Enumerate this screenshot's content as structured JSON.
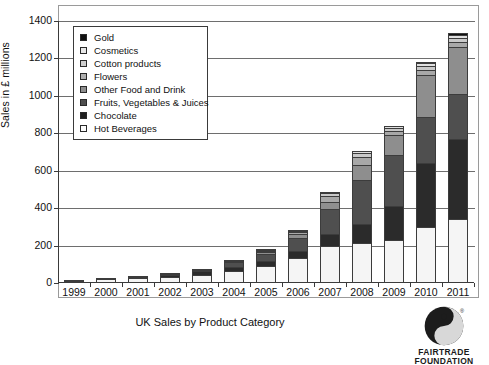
{
  "chart_data": {
    "type": "bar",
    "stacked": true,
    "title": "UK Sales by Product Category",
    "xlabel": "",
    "ylabel": "Sales in £ millions",
    "ylim": [
      0,
      1400
    ],
    "ytick_step": 200,
    "yticks": [
      "0",
      "200",
      "400",
      "600",
      "800",
      "1000",
      "1200",
      "1400"
    ],
    "grid": true,
    "legend_position": "top-left-inside",
    "categories": [
      "1999",
      "2000",
      "2001",
      "2002",
      "2003",
      "2004",
      "2005",
      "2006",
      "2007",
      "2008",
      "2009",
      "2010",
      "2011"
    ],
    "series": [
      {
        "name": "Hot Beverages",
        "color": "#f5f5f5",
        "values": [
          15,
          21,
          27,
          34,
          46,
          66,
          94,
          136,
          200,
          216,
          232,
          300,
          340
        ]
      },
      {
        "name": "Chocolate",
        "color": "#2b2b2b",
        "values": [
          1,
          5,
          10,
          14,
          19,
          25,
          30,
          36,
          60,
          100,
          180,
          340,
          430
        ]
      },
      {
        "name": "Fruits, Vegetables & Juices",
        "color": "#4f4f4f",
        "values": [
          0,
          0,
          2,
          4,
          8,
          25,
          40,
          70,
          135,
          235,
          270,
          250,
          240
        ]
      },
      {
        "name": "Other Food and Drink",
        "color": "#8e8e8e",
        "values": [
          0,
          0,
          0,
          1,
          2,
          5,
          10,
          20,
          40,
          80,
          110,
          220,
          250
        ]
      },
      {
        "name": "Flowers",
        "color": "#a8a8a8",
        "values": [
          0,
          0,
          0,
          0,
          0,
          2,
          5,
          12,
          28,
          40,
          20,
          30,
          28
        ]
      },
      {
        "name": "Cotton products",
        "color": "#c9c9c9",
        "values": [
          0,
          0,
          0,
          0,
          0,
          0,
          3,
          8,
          16,
          22,
          18,
          22,
          24
        ]
      },
      {
        "name": "Cosmetics",
        "color": "#e0e0e0",
        "values": [
          0,
          0,
          0,
          0,
          0,
          0,
          1,
          3,
          8,
          14,
          10,
          14,
          16
        ]
      },
      {
        "name": "Gold",
        "color": "#111111",
        "values": [
          0,
          0,
          0,
          0,
          0,
          0,
          0,
          0,
          0,
          0,
          0,
          4,
          7
        ]
      }
    ],
    "legend_entries": [
      {
        "label": "Gold",
        "color": "#111111"
      },
      {
        "label": "Cosmetics",
        "color": "#e8e8e8"
      },
      {
        "label": "Cotton products",
        "color": "#cfcfcf"
      },
      {
        "label": "Flowers",
        "color": "#b0b0b0"
      },
      {
        "label": "Other Food and Drink",
        "color": "#8e8e8e"
      },
      {
        "label": "Fruits, Vegetables & Juices",
        "color": "#4f4f4f"
      },
      {
        "label": "Chocolate",
        "color": "#1f1f1f"
      },
      {
        "label": "Hot Beverages",
        "color": "#fbfbfb"
      }
    ]
  },
  "logo": {
    "line1": "FAIRTRADE",
    "line2": "FOUNDATION"
  }
}
